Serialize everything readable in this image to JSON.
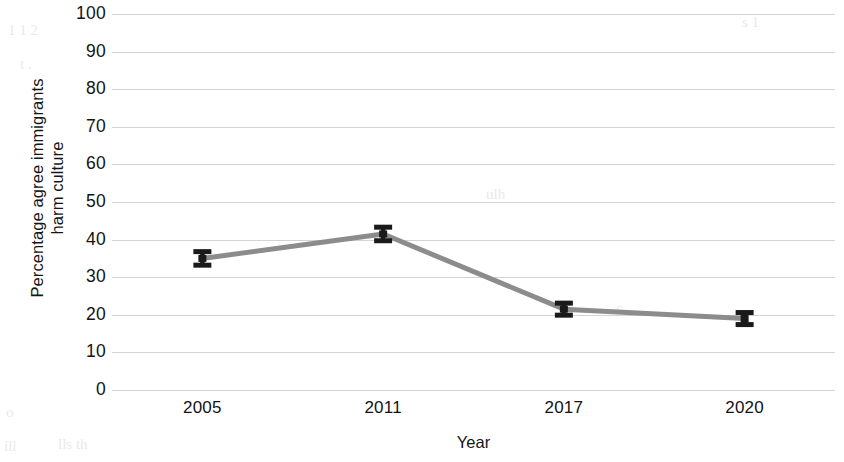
{
  "chart_data": {
    "type": "line",
    "title": "",
    "subtitle": "",
    "xlabel": "Year",
    "ylabel": "Percentage agree immigrants harm culture",
    "ylabel_line1": "Percentage agree immigrants",
    "ylabel_line2": "harm culture",
    "categories": [
      "2005",
      "2011",
      "2017",
      "2020"
    ],
    "x": [
      2005,
      2011,
      2017,
      2020
    ],
    "values": [
      35,
      41.5,
      21.5,
      19
    ],
    "errors": [
      1.8,
      1.8,
      1.6,
      1.6
    ],
    "series": [
      {
        "name": "Percentage agree immigrants harm culture",
        "values": [
          35,
          41.5,
          21.5,
          19
        ],
        "errors": [
          1.8,
          1.8,
          1.6,
          1.6
        ],
        "color": "#8c8c8c",
        "marker_color": "#1a1a1a"
      }
    ],
    "ylim": [
      0,
      100
    ],
    "yticks": [
      0,
      10,
      20,
      30,
      40,
      50,
      60,
      70,
      80,
      90,
      100
    ],
    "ytick_labels": [
      "0",
      "10",
      "20",
      "30",
      "40",
      "50",
      "60",
      "70",
      "80",
      "90",
      "100"
    ],
    "grid": true,
    "grid_axis": "y",
    "legend": false,
    "legend_position": "none",
    "error_bars": true,
    "background_color": "#ffffff",
    "grid_color": "#c9c9c9",
    "line_color": "#8c8c8c",
    "marker_color": "#1a1a1a",
    "text_color": "#131313"
  },
  "axes": {
    "y_title_line1": "Percentage agree immigrants",
    "y_title_line2": "harm culture",
    "x_title": "Year"
  },
  "scan_artifacts": {
    "marks": [
      "1 1 2",
      "s 1",
      "t .",
      "o",
      "ill",
      "lls th",
      "ulh",
      "c"
    ]
  }
}
